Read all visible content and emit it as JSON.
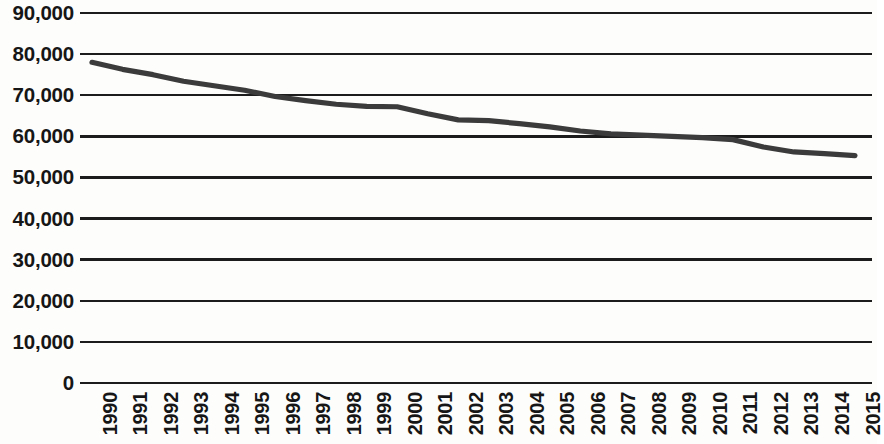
{
  "chart_data": {
    "type": "line",
    "title": "",
    "subtitle": "",
    "xlabel": "",
    "ylabel": "",
    "grid": "horizontal",
    "legend": "none",
    "ylim": [
      0,
      90000
    ],
    "ytick_step": 10000,
    "ytick_labels": [
      "90,000",
      "80,000",
      "70,000",
      "60,000",
      "50,000",
      "40,000",
      "30,000",
      "20,000",
      "10,000",
      "0"
    ],
    "ytick_values": [
      90000,
      80000,
      70000,
      60000,
      50000,
      40000,
      30000,
      20000,
      10000,
      0
    ],
    "categories": [
      "1990",
      "1991",
      "1992",
      "1993",
      "1994",
      "1995",
      "1996",
      "1997",
      "1998",
      "1999",
      "2000",
      "2001",
      "2002",
      "2003",
      "2004",
      "2005",
      "2006",
      "2007",
      "2008",
      "2009",
      "2010",
      "2011",
      "2012",
      "2013",
      "2014",
      "2015"
    ],
    "series": [
      {
        "name": "value",
        "color": "#3b3b3b",
        "values": [
          78000,
          76300,
          75000,
          73400,
          72300,
          71200,
          69700,
          68700,
          67800,
          67300,
          67200,
          65500,
          64000,
          63800,
          63100,
          62300,
          61300,
          60600,
          60300,
          60000,
          59700,
          59200,
          57400,
          56200,
          55800,
          55300
        ]
      }
    ]
  },
  "axis": {
    "y_labels": [
      "90,000",
      "80,000",
      "70,000",
      "60,000",
      "50,000",
      "40,000",
      "30,000",
      "20,000",
      "10,000",
      "0"
    ],
    "x_labels": [
      "1990",
      "1991",
      "1992",
      "1993",
      "1994",
      "1995",
      "1996",
      "1997",
      "1998",
      "1999",
      "2000",
      "2001",
      "2002",
      "2003",
      "2004",
      "2005",
      "2006",
      "2007",
      "2008",
      "2009",
      "2010",
      "2011",
      "2012",
      "2013",
      "2014",
      "2015"
    ]
  },
  "colors": {
    "line": "#3b3b3b",
    "grid": "#1c1c1c",
    "text": "#161616",
    "background": "#fdfdfc"
  }
}
